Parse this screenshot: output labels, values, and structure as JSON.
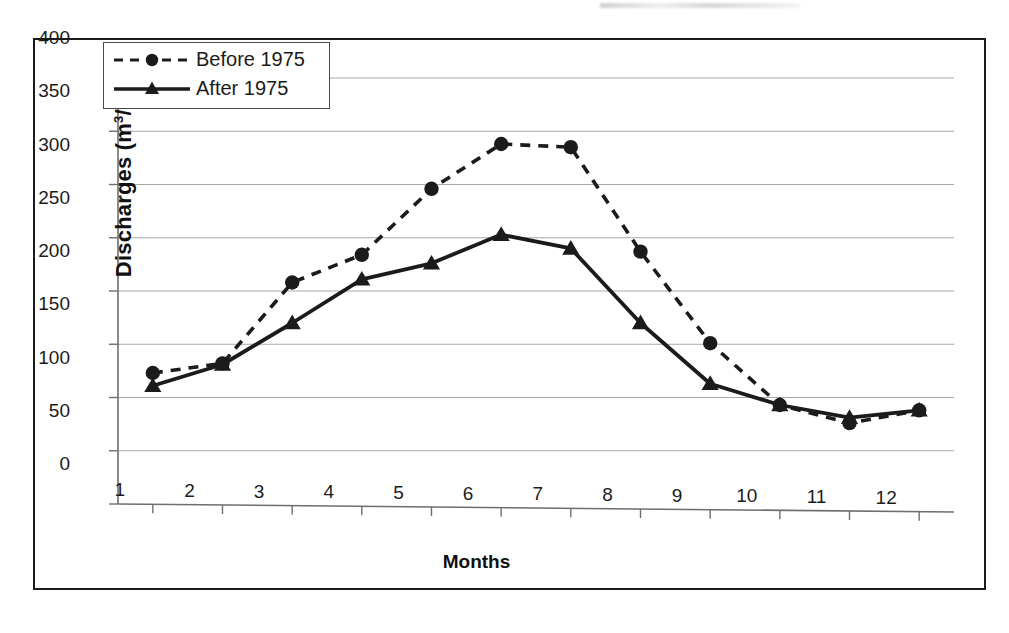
{
  "figure": {
    "background_color": "#ffffff",
    "border_color": "#1b1b1b",
    "series_color": "#1b1b1b",
    "gridline_color": "#a8a8a8",
    "axis_color": "#6e6e6e"
  },
  "legend": {
    "position": "top-left-inside",
    "entries": [
      {
        "label": "Before 1975",
        "marker": "circle",
        "linestyle": "dashed"
      },
      {
        "label": "After 1975",
        "marker": "triangle",
        "linestyle": "solid"
      }
    ]
  },
  "chart_data": {
    "type": "line",
    "title": "",
    "xlabel": "Months",
    "ylabel": "Discharges (m3/s)",
    "ylabel_display": "Discharges (m³/s)",
    "x": [
      1,
      2,
      3,
      4,
      5,
      6,
      7,
      8,
      9,
      10,
      11,
      12
    ],
    "categories": [
      "1",
      "2",
      "3",
      "4",
      "5",
      "6",
      "7",
      "8",
      "9",
      "10",
      "11",
      "12"
    ],
    "xlim": [
      0.5,
      12.5
    ],
    "ylim": [
      0,
      400
    ],
    "yticks": [
      0,
      50,
      100,
      150,
      200,
      250,
      300,
      350,
      400
    ],
    "ytick_labels": [
      "0",
      "50",
      "100",
      "150",
      "200",
      "250",
      "300",
      "350",
      "400"
    ],
    "xtick_labels": [
      "1",
      "2",
      "3",
      "4",
      "5",
      "6",
      "7",
      "8",
      "9",
      "10",
      "11",
      "12"
    ],
    "grid": "horizontal",
    "legend_position": "upper left",
    "series": [
      {
        "name": "Before 1975",
        "marker": "circle",
        "linestyle": "dashed",
        "values": [
          123,
          132,
          208,
          234,
          296,
          338,
          335,
          237,
          151,
          93,
          76,
          88
        ]
      },
      {
        "name": "After 1975",
        "marker": "triangle",
        "linestyle": "solid",
        "values": [
          111,
          131,
          170,
          211,
          226,
          253,
          240,
          170,
          113,
          93,
          81,
          88
        ]
      }
    ]
  }
}
